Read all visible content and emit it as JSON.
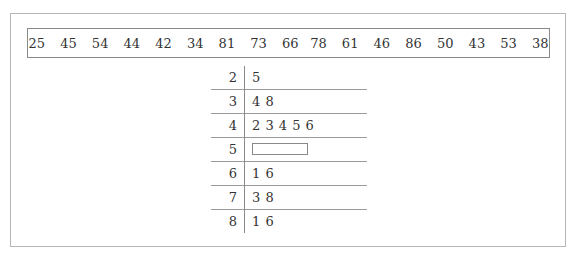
{
  "data_values": [
    "25",
    "45",
    "54",
    "44",
    "42",
    "34",
    "81",
    "73",
    "66",
    "78",
    "61",
    "46",
    "86",
    "50",
    "43",
    "53",
    "38"
  ],
  "stem_leaf": {
    "rows": [
      {
        "stem": "2",
        "leaves": "5"
      },
      {
        "stem": "3",
        "leaves": "4 8"
      },
      {
        "stem": "4",
        "leaves": "2 3 4 5 6"
      },
      {
        "stem": "5",
        "leaves": "",
        "blank": true
      },
      {
        "stem": "6",
        "leaves": "1 6"
      },
      {
        "stem": "7",
        "leaves": "3 8"
      },
      {
        "stem": "8",
        "leaves": "1 6"
      }
    ]
  }
}
